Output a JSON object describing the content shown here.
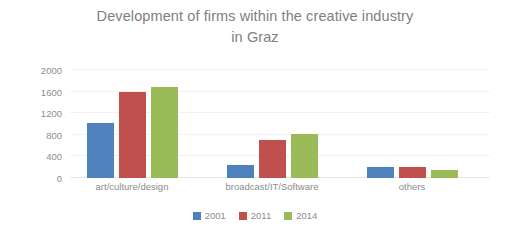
{
  "chart_data": {
    "type": "bar",
    "title": "Development of firms within the creative industry in Graz",
    "title_lines": [
      "Development of firms within the creative industry",
      "in Graz"
    ],
    "xlabel": "",
    "ylabel": "",
    "ylim": [
      0,
      2000
    ],
    "yticks": [
      0,
      400,
      800,
      1200,
      1600,
      2000
    ],
    "ytick_labels": [
      "0",
      "400",
      "800",
      "1200",
      "1600",
      "2000"
    ],
    "grid": true,
    "legend_position": "bottom",
    "categories": [
      "art/culture/design",
      "broadcast/IT/Software",
      "others"
    ],
    "series": [
      {
        "name": "2001",
        "color": "#4F81BD",
        "values": [
          1020,
          245,
          200
        ]
      },
      {
        "name": "2011",
        "color": "#C0504D",
        "values": [
          1590,
          700,
          195
        ]
      },
      {
        "name": "2014",
        "color": "#9BBB59",
        "values": [
          1690,
          810,
          145
        ]
      }
    ]
  },
  "style": {
    "title_color": "#808080",
    "tick_color": "#8c8c8c",
    "grid_color": "#f2f2f2",
    "background": "#ffffff"
  }
}
